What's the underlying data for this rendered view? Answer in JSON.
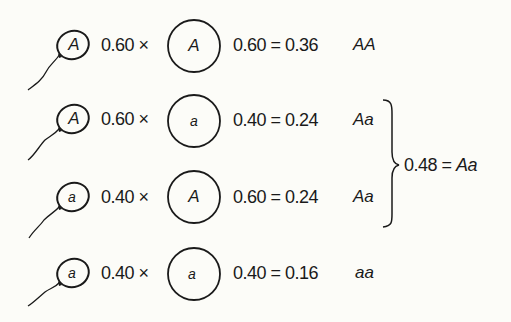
{
  "diagram": {
    "title": "",
    "rows": [
      {
        "sperm_allele": "A",
        "sperm_freq": "0.60",
        "times": "×",
        "egg_allele": "A",
        "egg_freq": "0.60",
        "equals": "=",
        "product": "0.36",
        "genotype": "AA"
      },
      {
        "sperm_allele": "A",
        "sperm_freq": "0.60",
        "times": "×",
        "egg_allele": "a",
        "egg_freq": "0.40",
        "equals": "=",
        "product": "0.24",
        "genotype": "Aa"
      },
      {
        "sperm_allele": "a",
        "sperm_freq": "0.40",
        "times": "×",
        "egg_allele": "A",
        "egg_freq": "0.60",
        "equals": "=",
        "product": "0.24",
        "genotype": "Aa"
      },
      {
        "sperm_allele": "a",
        "sperm_freq": "0.40",
        "times": "×",
        "egg_allele": "a",
        "egg_freq": "0.40",
        "equals": "=",
        "product": "0.16",
        "genotype": "aa"
      }
    ],
    "brace_sum": {
      "value": "0.48",
      "equals": "=",
      "genotype": "Aa"
    },
    "icons": {
      "sperm": "sperm-cell-icon",
      "egg": "egg-cell-icon",
      "brace": "right-curly-brace"
    },
    "colors": {
      "ink": "#1a1a1a",
      "background": "#fcfcf8"
    }
  }
}
